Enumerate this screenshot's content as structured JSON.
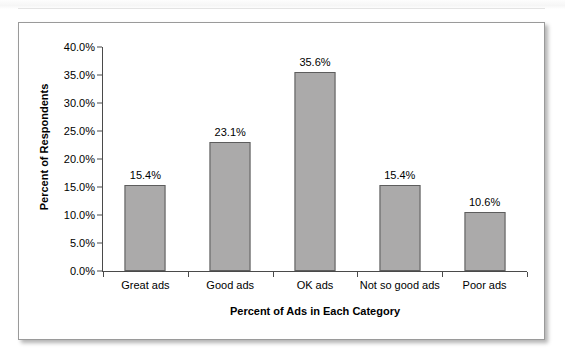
{
  "page": {
    "top_strip_ghost_text": "",
    "background_color": "#ffffff"
  },
  "figure": {
    "border_color": "#9a9a9a",
    "background_color": "#ffffff"
  },
  "chart_data": {
    "type": "bar",
    "title": "",
    "subtitle": "",
    "xlabel": "Percent of Ads in Each Category",
    "ylabel": "Percent of Respondents",
    "categories": [
      "Great ads",
      "Good ads",
      "OK ads",
      "Not so good ads",
      "Poor ads"
    ],
    "values": [
      15.4,
      23.1,
      35.6,
      15.4,
      10.6
    ],
    "value_labels": [
      "15.4%",
      "23.1%",
      "35.6%",
      "15.4%",
      "10.6%"
    ],
    "ylim": [
      0,
      40
    ],
    "ytick_values": [
      0,
      5,
      10,
      15,
      20,
      25,
      30,
      35,
      40
    ],
    "ytick_labels": [
      "0.0%",
      "5.0%",
      "10.0%",
      "15.0%",
      "20.0%",
      "25.0%",
      "30.0%",
      "35.0%",
      "40.0%"
    ],
    "grid": false,
    "legend": null,
    "legend_position": "none",
    "bar_fill_color": "#abaaaa",
    "bar_border_color": "#5d5d5d",
    "axis_color": "#4a4a4a",
    "text_color": "#000000"
  }
}
